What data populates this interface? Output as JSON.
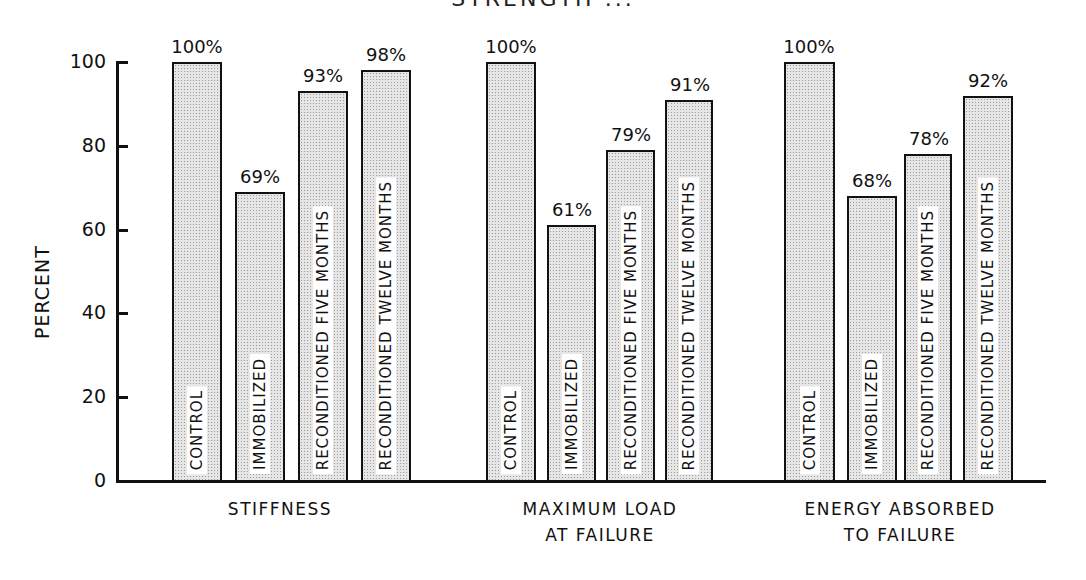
{
  "chart_data": {
    "type": "bar",
    "title": "STRENGTH ...",
    "xlabel": "",
    "ylabel": "PERCENT",
    "ylim": [
      0,
      100
    ],
    "yticks": [
      0,
      20,
      40,
      60,
      80,
      100
    ],
    "grid": false,
    "categories": [
      "STIFFNESS",
      "MAXIMUM LOAD\nAT FAILURE",
      "ENERGY ABSORBED\nTO FAILURE"
    ],
    "series": [
      {
        "name": "CONTROL",
        "values": [
          100,
          100,
          100
        ]
      },
      {
        "name": "IMMOBILIZED",
        "values": [
          69,
          61,
          68
        ]
      },
      {
        "name": "RECONDITIONED FIVE MONTHS",
        "values": [
          93,
          79,
          78
        ]
      },
      {
        "name": "RECONDITIONED TWELVE MONTHS",
        "values": [
          98,
          91,
          92
        ]
      }
    ],
    "value_labels": [
      [
        "100%",
        "69%",
        "93%",
        "98%"
      ],
      [
        "100%",
        "61%",
        "79%",
        "91%"
      ],
      [
        "100%",
        "68%",
        "78%",
        "92%"
      ]
    ],
    "legend_position": "none (series names written inside bars)"
  },
  "axis": {
    "ylabel": "PERCENT",
    "ticks": [
      "0",
      "20",
      "40",
      "60",
      "80",
      "100"
    ]
  },
  "groups": [
    {
      "label": "STIFFNESS",
      "bars": [
        {
          "name": "CONTROL",
          "value": "100%",
          "pct": 100,
          "x": 172,
          "w": 50
        },
        {
          "name": "IMMOBILIZED",
          "value": "69%",
          "pct": 69,
          "x": 235,
          "w": 50
        },
        {
          "name": "RECONDITIONED FIVE MONTHS",
          "value": "93%",
          "pct": 93,
          "x": 298,
          "w": 50
        },
        {
          "name": "RECONDITIONED TWELVE MONTHS",
          "value": "98%",
          "pct": 98,
          "x": 361,
          "w": 50
        }
      ],
      "label_x": 180,
      "label_w": 200
    },
    {
      "label": "MAXIMUM LOAD\nAT FAILURE",
      "bars": [
        {
          "name": "CONTROL",
          "value": "100%",
          "pct": 100,
          "x": 486,
          "w": 50
        },
        {
          "name": "IMMOBILIZED",
          "value": "61%",
          "pct": 61,
          "x": 547,
          "w": 49
        },
        {
          "name": "RECONDITIONED FIVE MONTHS",
          "value": "79%",
          "pct": 79,
          "x": 606,
          "w": 49
        },
        {
          "name": "RECONDITIONED TWELVE MONTHS",
          "value": "91%",
          "pct": 91,
          "x": 665,
          "w": 48
        }
      ],
      "label_x": 490,
      "label_w": 220
    },
    {
      "label": "ENERGY ABSORBED\nTO FAILURE",
      "bars": [
        {
          "name": "CONTROL",
          "value": "100%",
          "pct": 100,
          "x": 784,
          "w": 51
        },
        {
          "name": "IMMOBILIZED",
          "value": "68%",
          "pct": 68,
          "x": 847,
          "w": 50
        },
        {
          "name": "RECONDITIONED FIVE MONTHS",
          "value": "78%",
          "pct": 78,
          "x": 904,
          "w": 48
        },
        {
          "name": "RECONDITIONED TWELVE MONTHS",
          "value": "92%",
          "pct": 92,
          "x": 963,
          "w": 50
        }
      ],
      "label_x": 770,
      "label_w": 260
    }
  ]
}
